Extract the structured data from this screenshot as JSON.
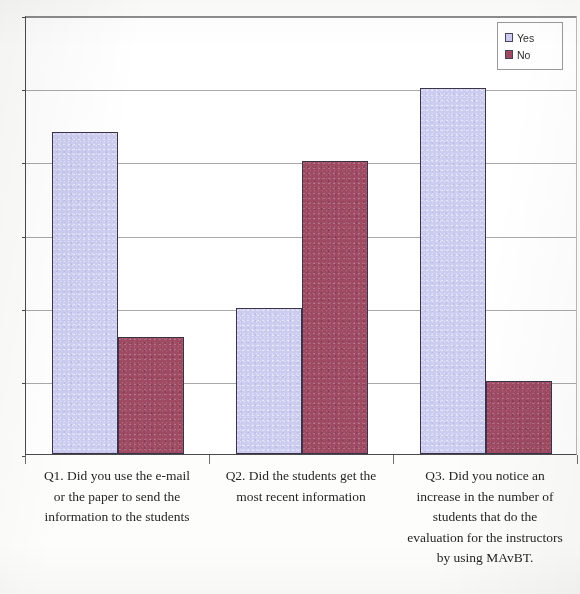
{
  "chart_data": {
    "type": "bar",
    "title": "",
    "subtitle": "",
    "xlabel": "",
    "ylabel": "",
    "ylim": [
      0,
      30
    ],
    "yticks": [
      0,
      5,
      10,
      15,
      20,
      25,
      30
    ],
    "ytick_labels": [
      "0",
      "5",
      "10",
      "15",
      "20",
      "25",
      "30"
    ],
    "grid": true,
    "grid_axis": "y",
    "legend_position": "top-right",
    "categories": [
      "Q1. Did you use the e-mail or the paper to send the information to the students",
      "Q2. Did the students get the most recent information",
      "Q3. Did you notice an increase in the number of students that do the evaluation for the instructors by using MAvBT."
    ],
    "category_lines": [
      [
        "Q1. Did you use the e-mail",
        "or the paper to send the",
        "information to the students"
      ],
      [
        "Q2. Did the students get the",
        "most recent information"
      ],
      [
        "Q3. Did you notice an",
        "increase in the number of",
        "students that do the",
        "evaluation for the instructors",
        "by using MAvBT."
      ]
    ],
    "series": [
      {
        "name": "Yes",
        "color": "#ccccf0",
        "values": [
          22,
          10,
          25
        ]
      },
      {
        "name": "No",
        "color": "#9e4a63",
        "values": [
          8,
          20,
          5
        ]
      }
    ]
  },
  "legend": {
    "items": [
      {
        "label": "Yes",
        "color": "#ccccf0"
      },
      {
        "label": "No",
        "color": "#9e4a63"
      }
    ]
  }
}
